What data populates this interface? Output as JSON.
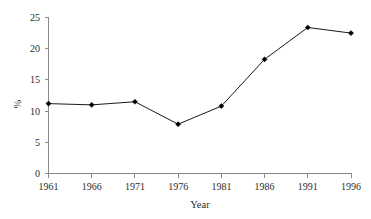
{
  "chart_data": {
    "type": "line",
    "title": "",
    "subtitle": "",
    "xlabel": "Year",
    "ylabel": "%",
    "categories": [
      "1961",
      "1966",
      "1971",
      "1976",
      "1981",
      "1986",
      "1991",
      "1996"
    ],
    "x": [
      1961,
      1966,
      1971,
      1976,
      1981,
      1986,
      1991,
      1996
    ],
    "values": [
      11.2,
      11.0,
      11.5,
      7.9,
      10.8,
      18.3,
      23.4,
      22.5
    ],
    "series": [
      {
        "name": "%",
        "values": [
          11.2,
          11.0,
          11.5,
          7.9,
          10.8,
          18.3,
          23.4,
          22.5
        ]
      }
    ],
    "xlim": [
      1961,
      1996
    ],
    "ylim": [
      0,
      25
    ],
    "ytick_labels": [
      "0",
      "5",
      "10",
      "15",
      "20",
      "25"
    ],
    "ytick_values": [
      0,
      5,
      10,
      15,
      20,
      25
    ],
    "xtick_labels": [
      "1961",
      "1966",
      "1971",
      "1976",
      "1981",
      "1986",
      "1991",
      "1996"
    ],
    "grid": false,
    "legend": false,
    "legend_position": "none",
    "marker": "diamond",
    "line_color": "#000000",
    "marker_color": "#000000",
    "axis_color": "#8a8a8a",
    "background_color": "#ffffff",
    "annotations": []
  }
}
